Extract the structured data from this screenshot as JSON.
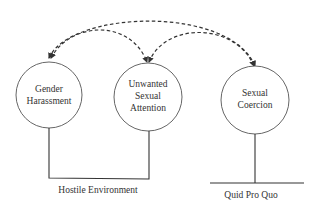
{
  "diagram": {
    "nodes": [
      {
        "id": "gender-harassment",
        "lines": [
          "Gender",
          "Harassment"
        ]
      },
      {
        "id": "unwanted-sexual-attention",
        "lines": [
          "Unwanted",
          "Sexual",
          "Attention"
        ]
      },
      {
        "id": "sexual-coercion",
        "lines": [
          "Sexual",
          "Coercion"
        ]
      }
    ],
    "groups": [
      {
        "id": "hostile-environment",
        "label": "Hostile Environment",
        "members": [
          "gender-harassment",
          "unwanted-sexual-attention"
        ]
      },
      {
        "id": "quid-pro-quo",
        "label": "Quid Pro Quo",
        "members": [
          "sexual-coercion"
        ]
      }
    ],
    "edges": [
      {
        "from": "gender-harassment",
        "to": "unwanted-sexual-attention",
        "style": "dashed",
        "direction": "bidirectional"
      },
      {
        "from": "unwanted-sexual-attention",
        "to": "sexual-coercion",
        "style": "dashed",
        "direction": "bidirectional"
      },
      {
        "from": "gender-harassment",
        "to": "sexual-coercion",
        "style": "dashed",
        "direction": "bidirectional"
      }
    ],
    "colors": {
      "line": "#333333",
      "circle": "#555555",
      "background": "#ffffff"
    }
  }
}
